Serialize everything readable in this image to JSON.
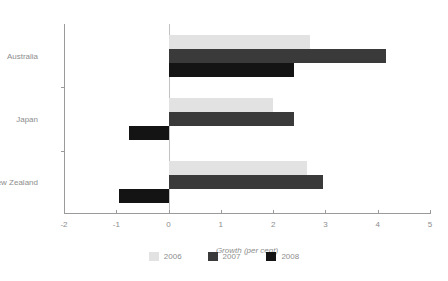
{
  "chart_data": {
    "type": "bar",
    "orientation": "horizontal",
    "title": "",
    "xlabel": "Growth (per cent)",
    "ylabel": "",
    "categories": [
      "Australia",
      "Japan",
      "New Zealand"
    ],
    "series": [
      {
        "name": "2006",
        "color": "#e2e2e2",
        "values": [
          2.7,
          2.0,
          2.65
        ]
      },
      {
        "name": "2007",
        "color": "#3a3a3a",
        "values": [
          4.15,
          2.4,
          2.95
        ]
      },
      {
        "name": "2008",
        "color": "#141414",
        "values": [
          2.4,
          -0.75,
          -0.95
        ]
      }
    ],
    "xlim": [
      -2,
      5
    ],
    "xticks": [
      -2,
      -1,
      0,
      1,
      2,
      3,
      4,
      5
    ],
    "xtick_labels": [
      "-2",
      "-1",
      "0",
      "1",
      "2",
      "3",
      "4",
      "5"
    ],
    "grid": false,
    "legend_position": "bottom",
    "zero_line": true
  },
  "legend": {
    "entries": [
      {
        "label": "2006"
      },
      {
        "label": "2007"
      },
      {
        "label": "2008"
      }
    ]
  }
}
